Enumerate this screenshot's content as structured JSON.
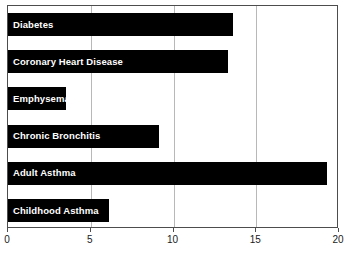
{
  "chart_data": {
    "type": "bar",
    "orientation": "horizontal",
    "title": "",
    "xlabel": "",
    "ylabel": "",
    "categories": [
      "Diabetes",
      "Coronary Heart Disease",
      "Emphysema",
      "Chronic Bronchitis",
      "Adult Asthma",
      "Childhood Asthma"
    ],
    "values": [
      13.6,
      13.3,
      3.5,
      9.1,
      19.3,
      6.1
    ],
    "xlim": [
      0,
      20
    ],
    "xticks": [
      0,
      5,
      10,
      15,
      20
    ],
    "xtick_labels": [
      "0",
      "5",
      "10",
      "15",
      "20"
    ],
    "grid": "vertical",
    "legend": "none",
    "bar_color": "#000000",
    "label_color": "#ffffff",
    "grid_color": "#b8b8b8",
    "frame_color": "#4d4d4d",
    "background_color": "#ffffff"
  }
}
